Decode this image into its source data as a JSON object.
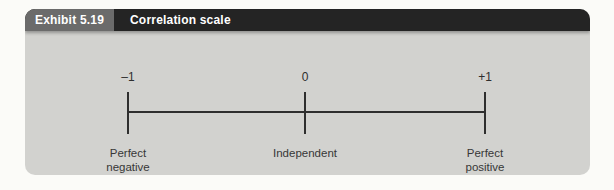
{
  "exhibit": {
    "label": "Exhibit 5.19",
    "title": "Correlation scale"
  },
  "scale": {
    "ticks": [
      {
        "value": "–1",
        "label": "Perfect\nnegative\ncorrelation"
      },
      {
        "value": "0",
        "label": "Independent"
      },
      {
        "value": "+1",
        "label": "Perfect\npositive\ncorrelation"
      }
    ]
  },
  "colors": {
    "panel_background": "#d2d2cf",
    "header_label_background": "#6b6b6b",
    "header_title_background": "#242424",
    "header_text": "#ffffff",
    "line": "#2e2e2e",
    "label_text": "#373737",
    "page_background": "#fbfbf8"
  }
}
